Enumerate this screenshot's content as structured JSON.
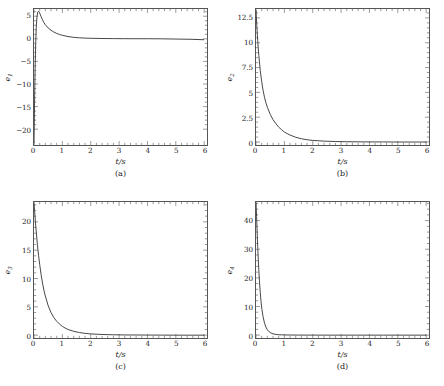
{
  "figure": {
    "panels": [
      {
        "id": "a",
        "caption": "(a)",
        "ylabel_base": "e",
        "ylabel_sub": "1",
        "xlabel": "t/s"
      },
      {
        "id": "b",
        "caption": "(b)",
        "ylabel_base": "e",
        "ylabel_sub": "2",
        "xlabel": "t/s"
      },
      {
        "id": "c",
        "caption": "(c)",
        "ylabel_base": "e",
        "ylabel_sub": "3",
        "xlabel": "t/s"
      },
      {
        "id": "d",
        "caption": "(d)",
        "ylabel_base": "e",
        "ylabel_sub": "4",
        "xlabel": "t/s"
      }
    ]
  },
  "chart_data": [
    {
      "type": "line",
      "panel": "a",
      "title": "",
      "xlabel": "t/s",
      "ylabel": "e1",
      "xlim": [
        0,
        6.1
      ],
      "ylim": [
        -23.5,
        6.6
      ],
      "xticks": [
        0,
        1,
        2,
        3,
        4,
        5,
        6
      ],
      "xticklabels": [
        "0",
        "1",
        "2",
        "3",
        "4",
        "5",
        "6"
      ],
      "yticks": [
        -20,
        -15,
        -10,
        -5,
        0,
        5
      ],
      "yticklabels": [
        "-20",
        "-15",
        "-10",
        "-5",
        "0",
        "5"
      ],
      "minor_ticks_per_major_x": 5,
      "minor_ticks_per_major_y": 5,
      "grid": false,
      "legend": false,
      "line_color": "#333333",
      "x": [
        0,
        0.02,
        0.04,
        0.06,
        0.08,
        0.1,
        0.13,
        0.16,
        0.2,
        0.25,
        0.3,
        0.35,
        0.4,
        0.5,
        0.6,
        0.7,
        0.8,
        0.9,
        1.0,
        1.2,
        1.4,
        1.6,
        1.8,
        2.0,
        2.4,
        2.8,
        3.2,
        3.6,
        4.0,
        4.5,
        5.0,
        5.5,
        6.0
      ],
      "y": [
        -23.2,
        -14.0,
        -6.5,
        -1.0,
        2.6,
        4.6,
        5.9,
        6.1,
        5.7,
        4.9,
        4.2,
        3.6,
        3.1,
        2.4,
        1.9,
        1.5,
        1.2,
        0.95,
        0.78,
        0.5,
        0.33,
        0.22,
        0.16,
        0.12,
        0.07,
        0.05,
        0.03,
        0.02,
        0.02,
        0.0,
        -0.05,
        -0.1,
        -0.2
      ]
    },
    {
      "type": "line",
      "panel": "b",
      "title": "",
      "xlabel": "t/s",
      "ylabel": "e2",
      "xlim": [
        0,
        6.1
      ],
      "ylim": [
        -0.3,
        13.4
      ],
      "xticks": [
        0,
        1,
        2,
        3,
        4,
        5,
        6
      ],
      "xticklabels": [
        "0",
        "1",
        "2",
        "3",
        "4",
        "5",
        "6"
      ],
      "yticks": [
        0,
        2.5,
        5,
        7.5,
        10,
        12.5
      ],
      "yticklabels": [
        "0",
        "2.5",
        "5",
        "7.5",
        "10",
        "12.5"
      ],
      "minor_ticks_per_major_x": 5,
      "minor_ticks_per_major_y": 5,
      "grid": false,
      "legend": false,
      "line_color": "#333333",
      "x": [
        0,
        0.03,
        0.06,
        0.1,
        0.15,
        0.2,
        0.25,
        0.3,
        0.35,
        0.4,
        0.5,
        0.6,
        0.7,
        0.8,
        0.9,
        1.0,
        1.1,
        1.2,
        1.4,
        1.6,
        1.8,
        2.0,
        2.4,
        2.8,
        3.2,
        3.6,
        4.0,
        4.5,
        5.0,
        5.5,
        6.0
      ],
      "y": [
        13.3,
        11.6,
        10.2,
        8.7,
        7.2,
        6.1,
        5.2,
        4.5,
        3.95,
        3.5,
        2.8,
        2.25,
        1.85,
        1.5,
        1.25,
        1.0,
        0.85,
        0.7,
        0.48,
        0.33,
        0.23,
        0.16,
        0.09,
        0.05,
        0.03,
        0.02,
        0.01,
        0.01,
        0.0,
        0.0,
        0.0
      ]
    },
    {
      "type": "line",
      "panel": "c",
      "title": "",
      "xlabel": "t/s",
      "ylabel": "e3",
      "xlim": [
        0,
        6.1
      ],
      "ylim": [
        -0.5,
        23.5
      ],
      "xticks": [
        0,
        1,
        2,
        3,
        4,
        5,
        6
      ],
      "xticklabels": [
        "0",
        "1",
        "2",
        "3",
        "4",
        "5",
        "6"
      ],
      "yticks": [
        0,
        5,
        10,
        15,
        20
      ],
      "yticklabels": [
        "0",
        "5",
        "10",
        "15",
        "20"
      ],
      "minor_ticks_per_major_x": 5,
      "minor_ticks_per_major_y": 5,
      "grid": false,
      "legend": false,
      "line_color": "#333333",
      "x": [
        0,
        0.02,
        0.05,
        0.08,
        0.12,
        0.16,
        0.2,
        0.25,
        0.3,
        0.35,
        0.4,
        0.5,
        0.6,
        0.7,
        0.8,
        0.9,
        1.0,
        1.1,
        1.2,
        1.4,
        1.6,
        1.8,
        2.0,
        2.4,
        2.8,
        3.2,
        3.6,
        4.0,
        4.5,
        5.0,
        5.5,
        6.0
      ],
      "y": [
        23.3,
        22.0,
        20.0,
        18.2,
        16.0,
        14.1,
        12.5,
        10.7,
        9.2,
        7.9,
        6.9,
        5.2,
        4.0,
        3.1,
        2.45,
        1.95,
        1.55,
        1.25,
        1.0,
        0.68,
        0.46,
        0.32,
        0.22,
        0.12,
        0.07,
        0.04,
        0.03,
        0.02,
        0.01,
        0.0,
        0.0,
        0.0
      ]
    },
    {
      "type": "line",
      "panel": "d",
      "title": "",
      "xlabel": "t/s",
      "ylabel": "e4",
      "xlim": [
        0,
        6.1
      ],
      "ylim": [
        -1.0,
        46.5
      ],
      "xticks": [
        0,
        1,
        2,
        3,
        4,
        5,
        6
      ],
      "xticklabels": [
        "0",
        "1",
        "2",
        "3",
        "4",
        "5",
        "6"
      ],
      "yticks": [
        0,
        10,
        20,
        30,
        40
      ],
      "yticklabels": [
        "0",
        "10",
        "20",
        "30",
        "40"
      ],
      "minor_ticks_per_major_x": 5,
      "minor_ticks_per_major_y": 5,
      "grid": false,
      "legend": false,
      "line_color": "#333333",
      "x": [
        0,
        0.01,
        0.02,
        0.04,
        0.06,
        0.08,
        0.1,
        0.12,
        0.15,
        0.18,
        0.21,
        0.25,
        0.3,
        0.35,
        0.4,
        0.45,
        0.5,
        0.6,
        0.7,
        0.8,
        0.9,
        1.0,
        1.2,
        1.5,
        2.0,
        2.5,
        3.0,
        3.5,
        4.0,
        4.5,
        5.0,
        5.5,
        6.0
      ],
      "y": [
        46.3,
        44.0,
        41.5,
        36.0,
        31.0,
        26.5,
        22.6,
        19.2,
        14.9,
        11.5,
        8.9,
        6.4,
        4.2,
        2.8,
        1.9,
        1.3,
        0.9,
        0.45,
        0.25,
        0.15,
        0.1,
        0.07,
        0.04,
        0.02,
        0.01,
        0.0,
        0.0,
        0.0,
        0.0,
        0.0,
        0.0,
        0.0,
        0.0
      ]
    }
  ]
}
